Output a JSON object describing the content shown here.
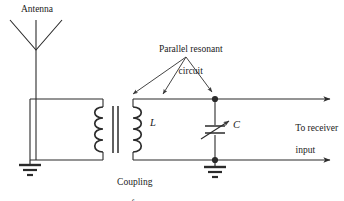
{
  "figure": {
    "width": 344,
    "height": 201,
    "background": "#ffffff",
    "line_color": "#2b2b2b",
    "text_color": "#1a1a1a"
  },
  "labels": {
    "antenna": "Antenna",
    "parallel_resonant": "Parallel resonant\ncircuit",
    "parallel_resonant_line1": "Parallel resonant",
    "parallel_resonant_line2": "circuit",
    "inductor": "L",
    "capacitor": "C",
    "to_receiver": "To receiver\ninput",
    "to_receiver_line1": "To receiver",
    "to_receiver_line2": "input",
    "coupling_transformer": "Coupling\ntransformer",
    "coupling_transformer_line1": "Coupling",
    "coupling_transformer_line2": "transformer"
  },
  "components": [
    {
      "name": "antenna",
      "type": "antenna-triangle",
      "label": "Antenna",
      "geometry": {
        "left": 10,
        "right": 62,
        "top": 20,
        "apex_x": 36,
        "apex_y": 50
      }
    },
    {
      "name": "ground-left",
      "type": "ground-symbol",
      "geometry": {
        "x": 30,
        "y": 160
      }
    },
    {
      "name": "coupling-transformer",
      "type": "transformer",
      "label": "Coupling transformer",
      "turns_primary": 4,
      "turns_secondary": 4,
      "core_lines": 2,
      "geometry": {
        "primary_x": 103,
        "secondary_x": 133,
        "top": 107,
        "bottom": 152
      }
    },
    {
      "name": "inductor-secondary",
      "type": "inductor",
      "label": "L"
    },
    {
      "name": "variable-capacitor",
      "type": "variable-capacitor",
      "label": "C",
      "geometry": {
        "x": 215,
        "y": 130
      }
    },
    {
      "name": "junction-node-top",
      "type": "junction-dot",
      "geometry": {
        "x": 215,
        "y": 99
      }
    },
    {
      "name": "junction-node-bottom",
      "type": "junction-dot",
      "geometry": {
        "x": 215,
        "y": 160
      }
    },
    {
      "name": "ground-right",
      "type": "ground-symbol",
      "geometry": {
        "x": 215,
        "y": 160
      }
    },
    {
      "name": "output-top",
      "type": "arrow-line",
      "label": "To receiver input",
      "geometry": {
        "x1": 215,
        "y1": 99,
        "x2": 332,
        "y2": 99
      }
    },
    {
      "name": "output-bottom",
      "type": "arrow-line",
      "geometry": {
        "x1": 215,
        "y1": 160,
        "x2": 332,
        "y2": 160
      }
    }
  ],
  "callouts": [
    {
      "name": "callout-arrow-left",
      "from_x": 186,
      "from_y": 56,
      "to_x": 132,
      "to_y": 96
    },
    {
      "name": "callout-arrow-middle",
      "from_x": 186,
      "from_y": 56,
      "to_x": 162,
      "to_y": 96
    },
    {
      "name": "callout-arrow-right",
      "from_x": 186,
      "from_y": 56,
      "to_x": 211,
      "to_y": 95
    }
  ],
  "colors": {
    "line": "#2b2b2b",
    "text": "#1a1a1a",
    "background": "#ffffff"
  }
}
